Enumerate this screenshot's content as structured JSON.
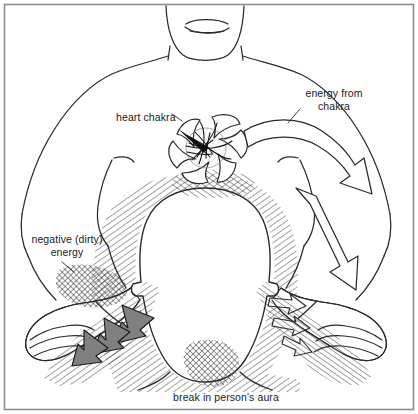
{
  "figure": {
    "border_color": "#8a8a8a",
    "ink_color": "#1a1a1a",
    "paper_color": "#ffffff",
    "dirty_arrow_fill": "#808080",
    "hatch_color": "#333333"
  },
  "labels": {
    "heart_chakra": "heart chakra",
    "energy_from_chakra_line1": "energy from",
    "energy_from_chakra_line2": "chakra",
    "negative_energy_line1": "negative (dirty)",
    "negative_energy_line2": "energy",
    "break_in_aura": "break in person's aura"
  }
}
